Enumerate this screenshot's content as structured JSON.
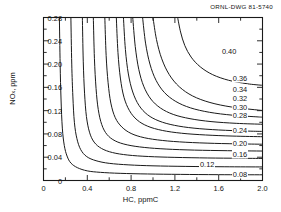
{
  "header": {
    "drawing_id": "ORNL-DWG 81-5740"
  },
  "axes": {
    "x": {
      "label": "HC, ppmC",
      "ticks": [
        "0",
        "0.4",
        "0.8",
        "1.2",
        "1.6",
        "2.0"
      ],
      "tick_values": [
        0,
        0.4,
        0.8,
        1.2,
        1.6,
        2.0
      ],
      "min": 0,
      "max": 2.0,
      "minor_step": 0.2
    },
    "y": {
      "label": "NOx, ppm",
      "label_base": "NO",
      "label_sub": "x",
      "label_tail": ", ppm",
      "ticks": [
        "0",
        "0.04",
        "0.08",
        "0.12",
        "0.16",
        "0.20",
        "0.24",
        "0.28"
      ],
      "tick_values": [
        0,
        0.04,
        0.08,
        0.12,
        0.16,
        0.2,
        0.24,
        0.28
      ],
      "min": 0,
      "max": 0.28,
      "minor_step": 0.02
    }
  },
  "style": {
    "line_color": "#1a1a1a",
    "frame_color": "#1a1a1a",
    "background": "#ffffff"
  },
  "chart_data": {
    "type": "line",
    "subtype": "contour-isopleth",
    "title": "",
    "xlabel": "HC, ppmC",
    "ylabel": "NOx, ppm",
    "xlim": [
      0,
      2.0
    ],
    "ylim": [
      0,
      0.28
    ],
    "grid": false,
    "legend": "none",
    "value_label_position": "right-edge",
    "levels": [
      0.08,
      0.12,
      0.16,
      0.2,
      0.24,
      0.28,
      0.3,
      0.32,
      0.34,
      0.36,
      0.4
    ],
    "level_labels": [
      "0.08",
      "0.12",
      "0.16",
      "0.20",
      "0.24",
      "0.28",
      "0.30",
      "0.32",
      "0.34",
      "0.36",
      "0.40"
    ],
    "annotations": [
      "ORNL-DWG 81-5740"
    ],
    "series": [
      {
        "name": "0.08",
        "label": "0.08",
        "label_xy": [
          1.72,
          0.012
        ],
        "points": [
          [
            0.145,
            0.28
          ],
          [
            0.152,
            0.2
          ],
          [
            0.16,
            0.14
          ],
          [
            0.172,
            0.09
          ],
          [
            0.19,
            0.06
          ],
          [
            0.215,
            0.042
          ],
          [
            0.25,
            0.03
          ],
          [
            0.31,
            0.022
          ],
          [
            0.4,
            0.0165
          ],
          [
            0.52,
            0.014
          ],
          [
            0.7,
            0.0123
          ],
          [
            0.95,
            0.0112
          ],
          [
            1.25,
            0.0105
          ],
          [
            1.6,
            0.01
          ],
          [
            2.0,
            0.0098
          ]
        ]
      },
      {
        "name": "0.12",
        "label": "0.12",
        "label_xy": [
          1.42,
          0.028
        ],
        "points": [
          [
            0.25,
            0.28
          ],
          [
            0.258,
            0.2
          ],
          [
            0.268,
            0.145
          ],
          [
            0.282,
            0.1
          ],
          [
            0.305,
            0.072
          ],
          [
            0.34,
            0.053
          ],
          [
            0.395,
            0.041
          ],
          [
            0.48,
            0.034
          ],
          [
            0.6,
            0.0295
          ],
          [
            0.78,
            0.0268
          ],
          [
            1.0,
            0.0252
          ],
          [
            1.3,
            0.0242
          ],
          [
            1.65,
            0.0236
          ],
          [
            2.0,
            0.0233
          ]
        ]
      },
      {
        "name": "0.16",
        "label": "0.16",
        "label_xy": [
          1.72,
          0.046
        ],
        "points": [
          [
            0.355,
            0.28
          ],
          [
            0.363,
            0.205
          ],
          [
            0.375,
            0.15
          ],
          [
            0.392,
            0.11
          ],
          [
            0.42,
            0.083
          ],
          [
            0.462,
            0.066
          ],
          [
            0.53,
            0.055
          ],
          [
            0.63,
            0.048
          ],
          [
            0.77,
            0.0437
          ],
          [
            0.96,
            0.0412
          ],
          [
            1.2,
            0.0397
          ],
          [
            1.5,
            0.0387
          ],
          [
            1.78,
            0.0382
          ],
          [
            2.0,
            0.0379
          ]
        ]
      },
      {
        "name": "0.20",
        "label": "0.20",
        "label_xy": [
          1.72,
          0.064
        ],
        "points": [
          [
            0.455,
            0.28
          ],
          [
            0.465,
            0.21
          ],
          [
            0.48,
            0.158
          ],
          [
            0.5,
            0.122
          ],
          [
            0.532,
            0.096
          ],
          [
            0.58,
            0.079
          ],
          [
            0.655,
            0.068
          ],
          [
            0.765,
            0.0612
          ],
          [
            0.92,
            0.0568
          ],
          [
            1.12,
            0.054
          ],
          [
            1.38,
            0.0522
          ],
          [
            1.68,
            0.0512
          ],
          [
            2.0,
            0.0506
          ]
        ]
      },
      {
        "name": "0.24",
        "label": "0.24",
        "label_xy": [
          1.72,
          0.086
        ],
        "points": [
          [
            0.56,
            0.28
          ],
          [
            0.572,
            0.215
          ],
          [
            0.59,
            0.168
          ],
          [
            0.615,
            0.133
          ],
          [
            0.655,
            0.108
          ],
          [
            0.715,
            0.092
          ],
          [
            0.8,
            0.0808
          ],
          [
            0.92,
            0.0735
          ],
          [
            1.085,
            0.0688
          ],
          [
            1.3,
            0.0657
          ],
          [
            1.56,
            0.0638
          ],
          [
            1.82,
            0.0628
          ],
          [
            2.0,
            0.0623
          ]
        ]
      },
      {
        "name": "0.28",
        "label": "0.28",
        "label_xy": [
          1.72,
          0.112
        ],
        "points": [
          [
            0.665,
            0.28
          ],
          [
            0.68,
            0.22
          ],
          [
            0.702,
            0.176
          ],
          [
            0.735,
            0.143
          ],
          [
            0.785,
            0.12
          ],
          [
            0.855,
            0.104
          ],
          [
            0.952,
            0.0932
          ],
          [
            1.085,
            0.086
          ],
          [
            1.26,
            0.0812
          ],
          [
            1.48,
            0.0782
          ],
          [
            1.73,
            0.0763
          ],
          [
            2.0,
            0.0752
          ]
        ]
      },
      {
        "name": "0.30",
        "label": "0.30",
        "label_xy": [
          1.72,
          0.127
        ],
        "points": [
          [
            0.73,
            0.28
          ],
          [
            0.748,
            0.225
          ],
          [
            0.775,
            0.183
          ],
          [
            0.815,
            0.152
          ],
          [
            0.872,
            0.129
          ],
          [
            0.95,
            0.113
          ],
          [
            1.055,
            0.1022
          ],
          [
            1.195,
            0.0948
          ],
          [
            1.375,
            0.0899
          ],
          [
            1.6,
            0.0868
          ],
          [
            1.845,
            0.085
          ],
          [
            2.0,
            0.0843
          ]
        ]
      },
      {
        "name": "0.32",
        "label": "0.32",
        "label_xy": [
          1.72,
          0.142
        ],
        "points": [
          [
            0.815,
            0.28
          ],
          [
            0.838,
            0.23
          ],
          [
            0.87,
            0.191
          ],
          [
            0.915,
            0.162
          ],
          [
            0.98,
            0.14
          ],
          [
            1.068,
            0.1245
          ],
          [
            1.185,
            0.1135
          ],
          [
            1.338,
            0.1062
          ],
          [
            1.53,
            0.1012
          ],
          [
            1.76,
            0.0982
          ],
          [
            2.0,
            0.0966
          ]
        ]
      },
      {
        "name": "0.34",
        "label": "0.34",
        "label_xy": [
          1.72,
          0.158
        ],
        "points": [
          [
            0.905,
            0.28
          ],
          [
            0.932,
            0.236
          ],
          [
            0.972,
            0.2
          ],
          [
            1.028,
            0.172
          ],
          [
            1.105,
            0.151
          ],
          [
            1.208,
            0.1358
          ],
          [
            1.342,
            0.1248
          ],
          [
            1.515,
            0.1172
          ],
          [
            1.725,
            0.1122
          ],
          [
            1.96,
            0.1092
          ],
          [
            2.0,
            0.1089
          ]
        ]
      },
      {
        "name": "0.36",
        "label": "0.36",
        "label_xy": [
          1.72,
          0.176
        ],
        "points": [
          [
            1.0,
            0.28
          ],
          [
            1.032,
            0.242
          ],
          [
            1.08,
            0.209
          ],
          [
            1.148,
            0.182
          ],
          [
            1.24,
            0.161
          ],
          [
            1.362,
            0.1452
          ],
          [
            1.52,
            0.134
          ],
          [
            1.718,
            0.1262
          ],
          [
            1.95,
            0.1212
          ],
          [
            2.0,
            0.1204
          ]
        ]
      },
      {
        "name": "0.40",
        "label": "0.40",
        "label_xy": [
          1.62,
          0.222
        ],
        "points": [
          [
            1.225,
            0.28
          ],
          [
            1.252,
            0.255
          ],
          [
            1.29,
            0.232
          ],
          [
            1.348,
            0.212
          ],
          [
            1.432,
            0.1952
          ],
          [
            1.545,
            0.1818
          ],
          [
            1.69,
            0.1722
          ],
          [
            1.86,
            0.1662
          ],
          [
            2.0,
            0.1635
          ]
        ]
      }
    ]
  }
}
